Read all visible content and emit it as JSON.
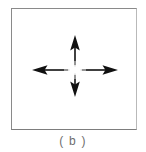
{
  "figure": {
    "caption": "( b )",
    "panel": {
      "background_color": "#ffffff",
      "border_color": "#8a8a8a"
    },
    "diagram": {
      "name": "four-way-arrow-cross",
      "stroke_color": "#111111",
      "center_gap": "yes",
      "arrows": [
        {
          "direction": "up",
          "label": "up-arrow"
        },
        {
          "direction": "down",
          "label": "down-arrow"
        },
        {
          "direction": "left",
          "label": "left-arrow"
        },
        {
          "direction": "right",
          "label": "right-arrow"
        }
      ]
    }
  }
}
